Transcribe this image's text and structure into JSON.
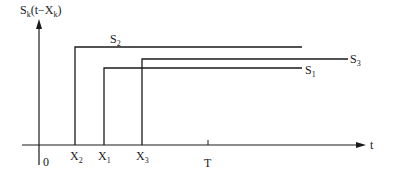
{
  "diagram": {
    "y_axis_label": {
      "main": "S",
      "sub": "k",
      "rest": "(t−X",
      "sub2": "k",
      "close": ")"
    },
    "x_axis_label": "t",
    "origin_label": "0",
    "ticks": [
      {
        "main": "X",
        "sub": "2"
      },
      {
        "main": "X",
        "sub": "1"
      },
      {
        "main": "X",
        "sub": "3"
      },
      {
        "main": "T",
        "sub": ""
      }
    ],
    "curves": [
      {
        "main": "S",
        "sub": "2"
      },
      {
        "main": "S",
        "sub": "3"
      },
      {
        "main": "S",
        "sub": "1"
      }
    ],
    "line_color": "#1a1a1a"
  }
}
